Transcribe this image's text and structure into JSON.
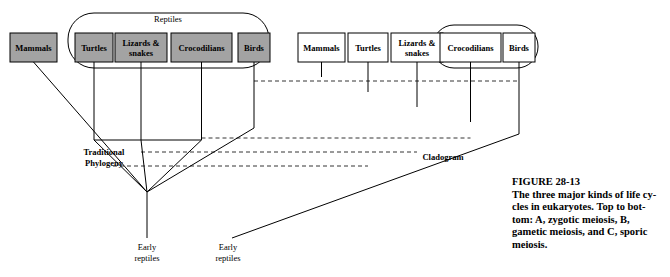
{
  "figure": {
    "number": "FIGURE 28-13",
    "caption_line1": "The three major kinds of life cy-",
    "caption_line2": "cles in eukaryotes. Top to bot-",
    "caption_line3_a": "tom: ",
    "caption_line3_b": "A,",
    "caption_line3_c": " zygotic meiosis, ",
    "caption_line3_d": "B,",
    "caption_line4_a": "gametic meiosis, and ",
    "caption_line4_b": "C,",
    "caption_line4_c": " sporic",
    "caption_line5": "meiosis."
  },
  "left_tree": {
    "name": "Traditional Phylogeny",
    "side_label_line1": "Traditional",
    "side_label_line2": "Phylogeny",
    "root_label_line1": "Early",
    "root_label_line2": "reptiles",
    "group_label": "Reptiles",
    "taxa": [
      {
        "label": "Mammals",
        "shaded": true
      },
      {
        "label": "Turtles",
        "shaded": true
      },
      {
        "label_line1": "Lizards &",
        "label_line2": "snakes",
        "shaded": true
      },
      {
        "label": "Crocodilians",
        "shaded": true
      },
      {
        "label": "Birds",
        "shaded": true
      }
    ]
  },
  "right_tree": {
    "name": "Cladogram",
    "side_label": "Cladogram",
    "root_label_line1": "Early",
    "root_label_line2": "reptiles",
    "taxa": [
      {
        "label": "Mammals",
        "shaded": false
      },
      {
        "label": "Turtles",
        "shaded": false
      },
      {
        "label_line1": "Lizards &",
        "label_line2": "snakes",
        "shaded": false
      },
      {
        "label": "Crocodilians",
        "shaded": false
      },
      {
        "label": "Birds",
        "shaded": false
      }
    ]
  },
  "colors": {
    "shaded_box_fill": "#a3a3a3",
    "plain_box_fill": "#ffffff",
    "stroke": "#000000",
    "background": "#ffffff"
  }
}
